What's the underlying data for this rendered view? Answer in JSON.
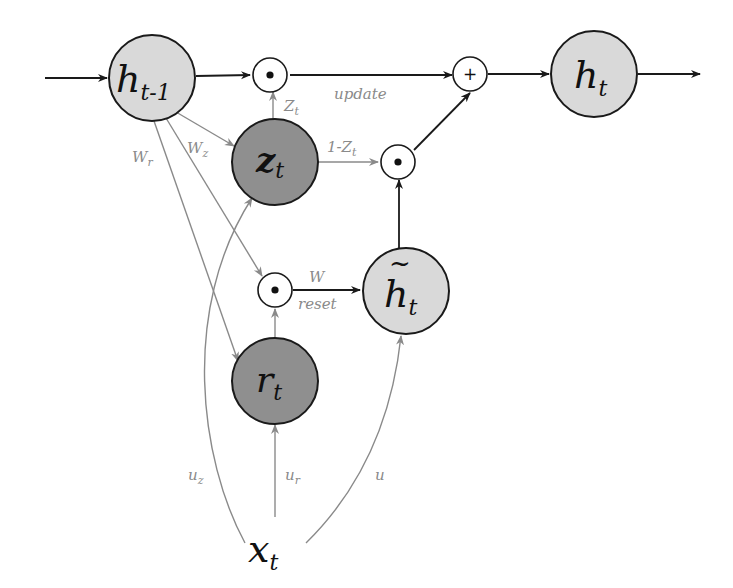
{
  "diagram": {
    "colors": {
      "light_node": "#d9d9d9",
      "dark_node": "#8f8f8f",
      "dark_edge": "#1a1a1a",
      "gray_edge": "#8a8a8a"
    },
    "nodes": {
      "h_prev": {
        "main": "h",
        "sub": "t-1"
      },
      "h_t": {
        "main": "h",
        "sub": "t"
      },
      "z_t": {
        "main": "z",
        "sub": "t"
      },
      "r_t": {
        "main": "r",
        "sub": "t"
      },
      "h_tilde": {
        "main": "h",
        "sub": "t",
        "accent": "~"
      },
      "x_t": {
        "main": "x",
        "sub": "t"
      }
    },
    "operators": {
      "mul_update": "•",
      "mul_candidate": "•",
      "mul_reset": "•",
      "add": "+"
    },
    "edge_labels": {
      "z_to_mul": {
        "main": "Z",
        "sub": "t"
      },
      "one_minus_z": {
        "main": "1-Z",
        "sub": "t"
      },
      "update": "update",
      "w": "W",
      "reset": "reset",
      "w_r": {
        "main": "W",
        "sub": "r"
      },
      "w_z": {
        "main": "W",
        "sub": "z"
      },
      "u_z": {
        "main": "u",
        "sub": "z"
      },
      "u_r": {
        "main": "u",
        "sub": "r"
      },
      "u": "u"
    }
  }
}
